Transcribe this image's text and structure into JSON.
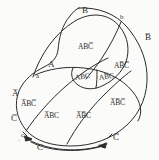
{
  "diagram": {
    "type": "venn-region-map",
    "stroke_color": "#2b2b2b",
    "background_color": "#fbfbfa",
    "variables": [
      "A",
      "B",
      "C"
    ],
    "boundary_labels": [
      {
        "id": "B-top",
        "text": "B",
        "kind": "uppercase",
        "x": 82,
        "y": 11
      },
      {
        "id": "b-right",
        "text": "b",
        "kind": "lowercase",
        "x": 120,
        "y": 18
      },
      {
        "id": "B-bar",
        "text": "B̅",
        "kind": "complement",
        "x": 145,
        "y": 38
      },
      {
        "id": "A-upper",
        "text": "A",
        "kind": "uppercase",
        "x": 48,
        "y": 64
      },
      {
        "id": "a-lower",
        "text": "a",
        "kind": "lowercase",
        "x": 36,
        "y": 76
      },
      {
        "id": "A-bar",
        "text": "A̅",
        "kind": "complement",
        "x": 13,
        "y": 94
      },
      {
        "id": "C-bar-left",
        "text": "C̅",
        "kind": "complement",
        "x": 12,
        "y": 119
      },
      {
        "id": "c-left",
        "text": "c",
        "kind": "lowercase",
        "x": 21,
        "y": 136
      },
      {
        "id": "C-bottom",
        "text": "C",
        "kind": "uppercase",
        "x": 37,
        "y": 148
      },
      {
        "id": "c-right",
        "text": "c",
        "kind": "lowercase",
        "x": 98,
        "y": 146
      },
      {
        "id": "C-bar-right",
        "text": "C̅",
        "kind": "complement",
        "x": 113,
        "y": 138
      }
    ],
    "regions": [
      {
        "id": "r1",
        "text": "ABC̅",
        "plain": "AB C-bar",
        "x": 87,
        "y": 47,
        "rot": 0
      },
      {
        "id": "r2",
        "text": "AB̅C̅",
        "plain": "A B-bar C-bar",
        "x": 122,
        "y": 66,
        "rot": 0
      },
      {
        "id": "r3",
        "text": "ABC",
        "plain": "ABC",
        "x": 81,
        "y": 77,
        "rot": -8
      },
      {
        "id": "r4",
        "text": "AB̅C",
        "plain": "A B-bar C",
        "x": 104,
        "y": 77,
        "rot": -8
      },
      {
        "id": "r5",
        "text": "A̅BC̅",
        "plain": "A-bar B C-bar",
        "x": 25,
        "y": 104,
        "rot": 0
      },
      {
        "id": "r6",
        "text": "A̅BC",
        "plain": "A-bar B C",
        "x": 48,
        "y": 116,
        "rot": 0
      },
      {
        "id": "r7",
        "text": "A̅B̅C",
        "plain": "A-bar B-bar C",
        "x": 80,
        "y": 116,
        "rot": 0
      },
      {
        "id": "r8",
        "text": "A̅B̅C̅",
        "plain": "A-bar B-bar C-bar",
        "x": 116,
        "y": 103,
        "rot": 0
      }
    ],
    "arrow_notes": [
      {
        "id": "arrow-left",
        "direction": "left",
        "near": "c"
      },
      {
        "id": "arrow-right",
        "direction": "right",
        "near": "c"
      }
    ]
  }
}
